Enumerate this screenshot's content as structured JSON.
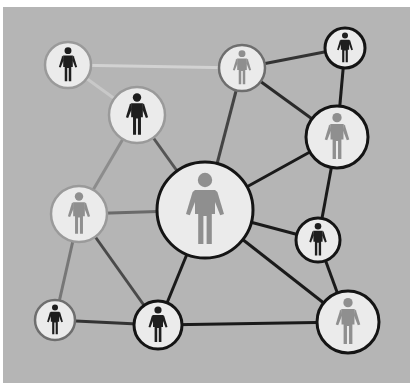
{
  "diagram": {
    "title": "",
    "background": "#ffffff",
    "panel": {
      "x": 3,
      "y": 7,
      "w": 407,
      "h": 376,
      "color": "#b5b5b5"
    },
    "colors": {
      "node_fill": "#ebebeb",
      "figure_dark": "#1e1e1e",
      "figure_gray": "#8f8f8f",
      "border_dark": "#141414",
      "border_light": "#9a9a9a"
    },
    "nodes": [
      {
        "id": "A",
        "x": 68,
        "y": 65,
        "r": 23,
        "figure": "dark",
        "border": "light"
      },
      {
        "id": "B",
        "x": 137,
        "y": 115,
        "r": 28,
        "figure": "dark",
        "border": "light"
      },
      {
        "id": "C",
        "x": 242,
        "y": 68,
        "r": 23,
        "figure": "gray",
        "border": "mid"
      },
      {
        "id": "D",
        "x": 345,
        "y": 48,
        "r": 20,
        "figure": "dark",
        "border": "dark"
      },
      {
        "id": "E",
        "x": 337,
        "y": 137,
        "r": 31,
        "figure": "gray",
        "border": "dark"
      },
      {
        "id": "F",
        "x": 205,
        "y": 210,
        "r": 48,
        "figure": "gray",
        "border": "dark"
      },
      {
        "id": "G",
        "x": 79,
        "y": 214,
        "r": 28,
        "figure": "gray",
        "border": "light"
      },
      {
        "id": "H",
        "x": 318,
        "y": 240,
        "r": 22,
        "figure": "dark",
        "border": "dark"
      },
      {
        "id": "I",
        "x": 55,
        "y": 320,
        "r": 20,
        "figure": "dark",
        "border": "mid"
      },
      {
        "id": "J",
        "x": 158,
        "y": 325,
        "r": 24,
        "figure": "dark",
        "border": "dark"
      },
      {
        "id": "K",
        "x": 348,
        "y": 322,
        "r": 31,
        "figure": "gray",
        "border": "dark"
      }
    ],
    "edges": [
      {
        "from": "A",
        "to": "C",
        "tone": "#d2d2d2"
      },
      {
        "from": "A",
        "to": "B",
        "tone": "#c8c8c8"
      },
      {
        "from": "B",
        "to": "G",
        "tone": "#8c8c8c"
      },
      {
        "from": "B",
        "to": "F",
        "tone": "#555555"
      },
      {
        "from": "C",
        "to": "F",
        "tone": "#444444"
      },
      {
        "from": "C",
        "to": "D",
        "tone": "#333333"
      },
      {
        "from": "C",
        "to": "E",
        "tone": "#2a2a2a"
      },
      {
        "from": "D",
        "to": "E",
        "tone": "#1a1a1a"
      },
      {
        "from": "E",
        "to": "F",
        "tone": "#1a1a1a"
      },
      {
        "from": "E",
        "to": "H",
        "tone": "#1a1a1a"
      },
      {
        "from": "F",
        "to": "G",
        "tone": "#6a6a6a"
      },
      {
        "from": "F",
        "to": "H",
        "tone": "#1a1a1a"
      },
      {
        "from": "F",
        "to": "J",
        "tone": "#1a1a1a"
      },
      {
        "from": "F",
        "to": "K",
        "tone": "#1a1a1a"
      },
      {
        "from": "G",
        "to": "I",
        "tone": "#777777"
      },
      {
        "from": "G",
        "to": "J",
        "tone": "#4a4a4a"
      },
      {
        "from": "H",
        "to": "K",
        "tone": "#1a1a1a"
      },
      {
        "from": "I",
        "to": "J",
        "tone": "#333333"
      },
      {
        "from": "J",
        "to": "K",
        "tone": "#1a1a1a"
      }
    ]
  }
}
